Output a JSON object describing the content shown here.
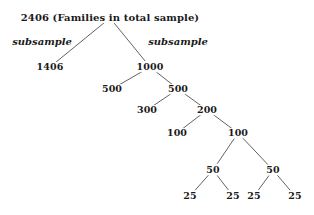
{
  "figure": {
    "background_color": "#ffffff",
    "line_color": "#3a3a3a",
    "text_color": "#1a1a1a"
  },
  "chart_data": {
    "type": "diagram",
    "title": "",
    "subtype": "binary-split-tree",
    "root_label": "2406 (Families in total sample)",
    "nodes": [
      {
        "id": "n2406",
        "label": "2406 (Families in total sample)",
        "value": 2406,
        "x": 110,
        "y": 18,
        "level": 0
      },
      {
        "id": "n1406",
        "label": "1406",
        "value": 1406,
        "x": 50,
        "y": 67,
        "level": 1
      },
      {
        "id": "n1000",
        "label": "1000",
        "value": 1000,
        "x": 150,
        "y": 67,
        "level": 1
      },
      {
        "id": "n500a",
        "label": "500",
        "value": 500,
        "x": 112,
        "y": 89,
        "level": 2
      },
      {
        "id": "n500b",
        "label": "500",
        "value": 500,
        "x": 178,
        "y": 89,
        "level": 2
      },
      {
        "id": "n300",
        "label": "300",
        "value": 300,
        "x": 147,
        "y": 110,
        "level": 3
      },
      {
        "id": "n200",
        "label": "200",
        "value": 200,
        "x": 207,
        "y": 110,
        "level": 3
      },
      {
        "id": "n100a",
        "label": "100",
        "value": 100,
        "x": 177,
        "y": 133,
        "level": 4
      },
      {
        "id": "n100b",
        "label": "100",
        "value": 100,
        "x": 238,
        "y": 133,
        "level": 4
      },
      {
        "id": "n50a",
        "label": "50",
        "value": 50,
        "x": 213,
        "y": 170,
        "level": 5
      },
      {
        "id": "n50b",
        "label": "50",
        "value": 50,
        "x": 273,
        "y": 170,
        "level": 5
      },
      {
        "id": "n25a",
        "label": "25",
        "value": 25,
        "x": 190,
        "y": 196,
        "level": 6
      },
      {
        "id": "n25b",
        "label": "25",
        "value": 25,
        "x": 233,
        "y": 196,
        "level": 6
      },
      {
        "id": "n25c",
        "label": "25",
        "value": 25,
        "x": 254,
        "y": 196,
        "level": 6
      },
      {
        "id": "n25d",
        "label": "25",
        "value": 25,
        "x": 295,
        "y": 196,
        "level": 6
      }
    ],
    "edges": [
      {
        "from": "n2406",
        "to": "n1406",
        "label": "subsample"
      },
      {
        "from": "n2406",
        "to": "n1000",
        "label": "subsample"
      },
      {
        "from": "n1000",
        "to": "n500a",
        "label": ""
      },
      {
        "from": "n1000",
        "to": "n500b",
        "label": ""
      },
      {
        "from": "n500b",
        "to": "n300",
        "label": ""
      },
      {
        "from": "n500b",
        "to": "n200",
        "label": ""
      },
      {
        "from": "n200",
        "to": "n100a",
        "label": ""
      },
      {
        "from": "n200",
        "to": "n100b",
        "label": ""
      },
      {
        "from": "n100b",
        "to": "n50a",
        "label": ""
      },
      {
        "from": "n100b",
        "to": "n50b",
        "label": ""
      },
      {
        "from": "n50a",
        "to": "n25a",
        "label": ""
      },
      {
        "from": "n50a",
        "to": "n25b",
        "label": ""
      },
      {
        "from": "n50b",
        "to": "n25c",
        "label": ""
      },
      {
        "from": "n50b",
        "to": "n25d",
        "label": ""
      }
    ],
    "edge_labels": [
      {
        "id": "lbl_left",
        "text": "subsample",
        "x": 42,
        "y": 42
      },
      {
        "id": "lbl_right",
        "text": "subsample",
        "x": 178,
        "y": 42
      }
    ]
  }
}
